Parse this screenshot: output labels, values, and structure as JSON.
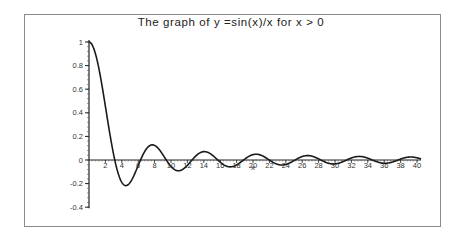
{
  "chart_data": {
    "type": "line",
    "title": "The graph of y =sin(x)/x for x > 0",
    "xlabel": "x",
    "ylabel": "",
    "xlim": [
      0,
      40
    ],
    "ylim": [
      -0.4,
      1
    ],
    "x_ticks": [
      2,
      4,
      6,
      8,
      10,
      12,
      14,
      16,
      18,
      20,
      22,
      24,
      26,
      28,
      30,
      32,
      34,
      36,
      38,
      40
    ],
    "y_ticks": [
      -0.4,
      -0.2,
      0,
      0.2,
      0.4,
      0.6,
      0.8,
      1
    ],
    "y_tick_labels": [
      "-0.4",
      "-0.2",
      "0",
      "0.2",
      "0.4",
      "0.6",
      "0.8",
      "1"
    ],
    "grid": false,
    "legend": null,
    "series": [
      {
        "name": "sin(x)/x",
        "function": "sin(x)/x",
        "x_range": [
          0,
          40.5
        ],
        "color": "#1a1a1a",
        "key_points": [
          {
            "x": 0,
            "y": 1.0
          },
          {
            "x": 3.14,
            "y": 0.0
          },
          {
            "x": 4.49,
            "y": -0.217
          },
          {
            "x": 6.28,
            "y": 0.0
          },
          {
            "x": 7.73,
            "y": 0.128
          },
          {
            "x": 9.42,
            "y": 0.0
          },
          {
            "x": 10.9,
            "y": -0.091
          },
          {
            "x": 14.07,
            "y": 0.071
          },
          {
            "x": 17.22,
            "y": -0.058
          },
          {
            "x": 20.37,
            "y": 0.049
          },
          {
            "x": 23.52,
            "y": -0.042
          },
          {
            "x": 26.67,
            "y": 0.037
          },
          {
            "x": 29.82,
            "y": -0.034
          },
          {
            "x": 32.97,
            "y": 0.03
          },
          {
            "x": 36.11,
            "y": -0.028
          },
          {
            "x": 39.26,
            "y": 0.025
          }
        ]
      }
    ]
  },
  "layout": {
    "origin_px": [
      89,
      160
    ],
    "x_px_per_unit": 8.2,
    "y_px_per_unit": 118
  }
}
